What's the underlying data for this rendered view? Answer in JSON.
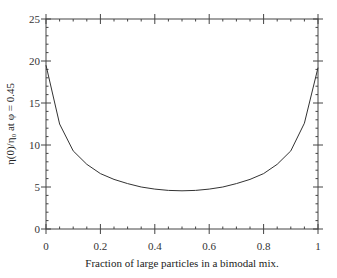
{
  "chart_data": {
    "type": "line",
    "title": "",
    "xlabel": "Fraction of large particles in a bimodal mix.",
    "ylabel": "η(0)/η₀  at φ = 0.45",
    "xlim": [
      0,
      1
    ],
    "ylim": [
      0,
      25
    ],
    "grid": false,
    "legend": null,
    "x_ticks": [
      "0",
      "0.2",
      "0.4",
      "0.6",
      "0.8",
      "1"
    ],
    "y_ticks": [
      "0",
      "5",
      "10",
      "15",
      "20",
      "25"
    ],
    "x_minor_step": 0.05,
    "y_minor_step": 1,
    "series": [
      {
        "name": "η(0)/η₀",
        "color": "#333333",
        "x": [
          0,
          0.05,
          0.1,
          0.15,
          0.2,
          0.25,
          0.3,
          0.35,
          0.4,
          0.45,
          0.5,
          0.55,
          0.6,
          0.65,
          0.7,
          0.75,
          0.8,
          0.85,
          0.9,
          0.95,
          1
        ],
        "values": [
          19.5,
          12.5,
          9.3,
          7.7,
          6.6,
          5.9,
          5.4,
          5.0,
          4.75,
          4.6,
          4.55,
          4.6,
          4.75,
          5.0,
          5.4,
          5.9,
          6.6,
          7.7,
          9.3,
          12.6,
          19.2
        ]
      }
    ]
  }
}
